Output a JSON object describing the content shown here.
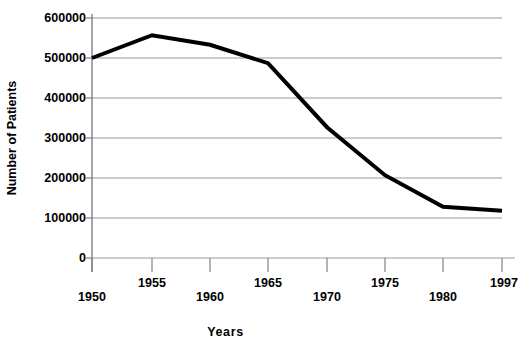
{
  "chart_data": {
    "type": "line",
    "title": "",
    "xlabel": "Years",
    "ylabel": "Number of Patients",
    "x": [
      1950,
      1955,
      1960,
      1965,
      1970,
      1975,
      1980,
      1997
    ],
    "categories": [
      "1950",
      "1955",
      "1960",
      "1965",
      "1970",
      "1975",
      "1980",
      "1997"
    ],
    "values": [
      500000,
      557000,
      533000,
      487000,
      327000,
      207000,
      128000,
      118000
    ],
    "series": [
      {
        "name": "Number of Patients",
        "values": [
          500000,
          557000,
          533000,
          487000,
          327000,
          207000,
          128000,
          118000
        ]
      }
    ],
    "ylim": [
      0,
      600000
    ],
    "ytick_labels": [
      "600000",
      "500000",
      "400000",
      "300000",
      "200000",
      "100000",
      "0"
    ],
    "ytick_values": [
      600000,
      500000,
      400000,
      300000,
      200000,
      100000,
      0
    ],
    "xtick_labels": [
      "1950",
      "1955",
      "1960",
      "1965",
      "1970",
      "1975",
      "1980",
      "1997"
    ],
    "xtick_stagger": [
      "low",
      "high",
      "low",
      "high",
      "low",
      "high",
      "low",
      "high"
    ],
    "grid": "horizontal",
    "legend": "none",
    "line_color": "#000000",
    "grid_color": "#9a9a9a",
    "axis_color": "#808080",
    "background": "#ffffff"
  }
}
